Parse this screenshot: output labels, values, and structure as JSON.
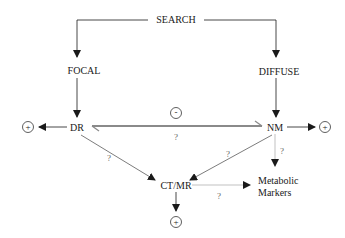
{
  "nodes": {
    "search": "SEARCH",
    "focal": "FOCAL",
    "diffuse": "DIFFUSE",
    "dr": "DR",
    "nm": "NM",
    "ctmr": "CT/MR",
    "metabolic_line1": "Metabolic",
    "metabolic_line2": "Markers"
  },
  "signs": {
    "plus": "+",
    "minus": "-"
  },
  "edge_labels": {
    "dr_nm_uncertain": "?",
    "dr_ctmr_uncertain": "?",
    "nm_ctmr_uncertain": "?",
    "nm_metabolic_uncertain": "?",
    "ctmr_metabolic_uncertain": "?"
  },
  "colors": {
    "line": "#1a1a1a",
    "faint_line": "#777777",
    "double_line": "#8a8a8a",
    "text": "#1a1a1a",
    "question": "#666666"
  }
}
